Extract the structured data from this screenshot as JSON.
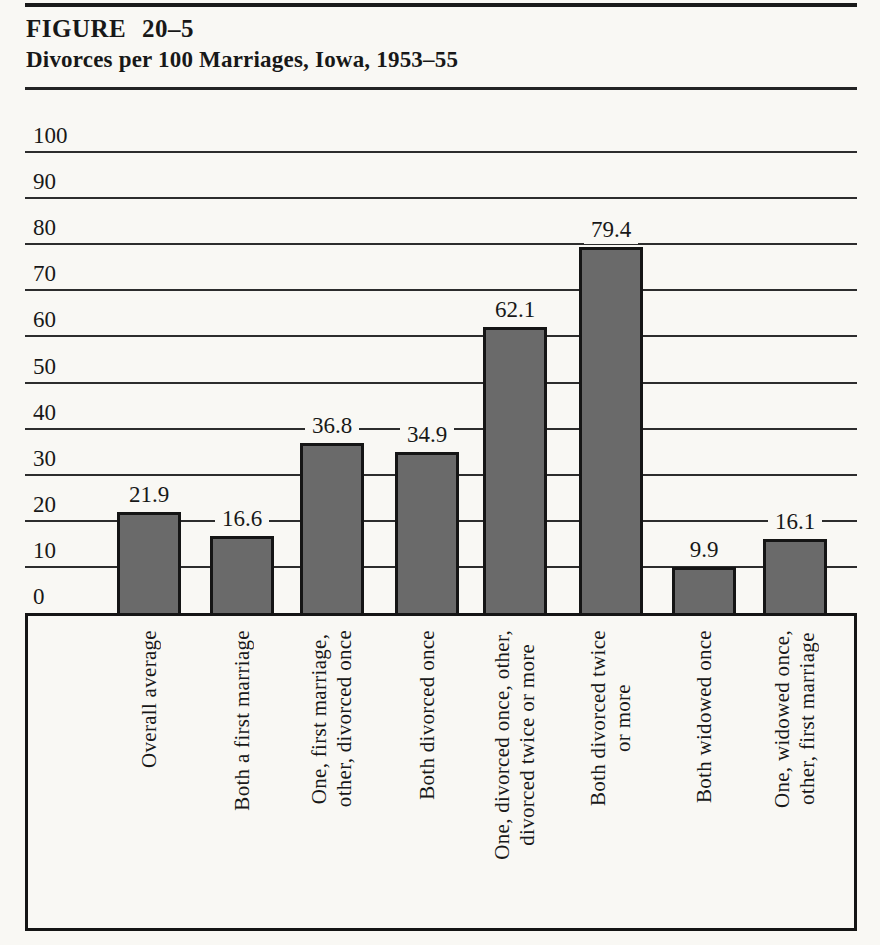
{
  "figure": {
    "label": "FIGURE 20–5",
    "title": "Divorces per 100 Marriages, Iowa, 1953–55"
  },
  "chart_data": {
    "type": "bar",
    "title": "Divorces per 100 Marriages, Iowa, 1953–55",
    "categories": [
      "Overall average",
      "Both a first marriage",
      "One, first marriage,\nother, divorced once",
      "Both divorced once",
      "One, divorced once, other,\ndivorced twice or more",
      "Both divorced twice\nor more",
      "Both widowed once",
      "One, widowed once,\nother, first marriage"
    ],
    "values": [
      21.9,
      16.6,
      36.8,
      34.9,
      62.1,
      79.4,
      9.9,
      16.1
    ],
    "value_labels": [
      "21.9",
      "16.6",
      "36.8",
      "34.9",
      "62.1",
      "79.4",
      "9.9",
      "16.1"
    ],
    "xlabel": "",
    "ylabel": "",
    "ylim": [
      0,
      100
    ],
    "ytick_interval": 10,
    "yticks": [
      "0",
      "10",
      "20",
      "30",
      "40",
      "50",
      "60",
      "70",
      "80",
      "90",
      "100"
    ],
    "grid": "horizontal",
    "legend": "none",
    "bar_color": "#6a6a6a",
    "bar_border_color": "#151515",
    "grid_color": "#2d2d2d",
    "text_color": "#181818",
    "background_color": "#f9f8f4"
  }
}
